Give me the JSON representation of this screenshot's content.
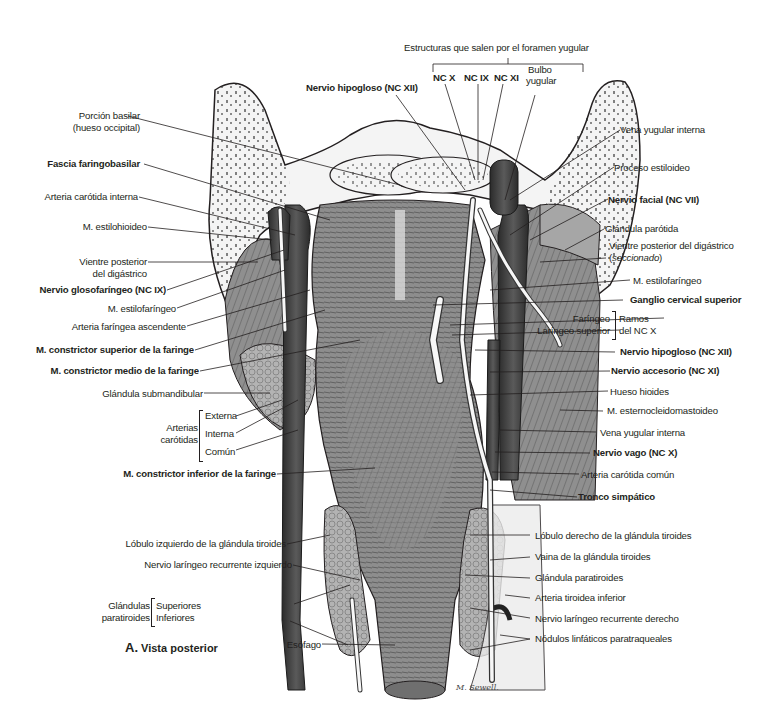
{
  "figure": {
    "caption_letter": "A.",
    "caption_text": "Vista posterior",
    "signature": "M. Sewell."
  },
  "top_group": {
    "title": "Estructuras que salen por el foramen yugular",
    "items": [
      "NC X",
      "NC IX",
      "NC XI"
    ],
    "bulbo_line1": "Bulbo",
    "bulbo_line2": "yugular"
  },
  "labels_left": [
    {
      "id": "porcion-basilar-1",
      "text": "Porción basilar",
      "bold": false
    },
    {
      "id": "porcion-basilar-2",
      "text": "(hueso occipital)",
      "bold": false
    },
    {
      "id": "fascia-faringobasilar",
      "text": "Fascia faringobasilar",
      "bold": true
    },
    {
      "id": "arteria-carotida-interna",
      "text": "Arteria carótida interna",
      "bold": false
    },
    {
      "id": "m-estilohioideo",
      "text": "M. estilohioideo",
      "bold": false
    },
    {
      "id": "vientre-posterior-1",
      "text": "Vientre posterior",
      "bold": false
    },
    {
      "id": "vientre-posterior-2",
      "text": "del digástrico",
      "bold": false
    },
    {
      "id": "nervio-glosofaringeo",
      "text": "Nervio glosofaríngeo (NC IX)",
      "bold": true
    },
    {
      "id": "m-estilofaringeo-left",
      "text": "M. estilofaríngeo",
      "bold": false
    },
    {
      "id": "arteria-faringea-ascendente",
      "text": "Arteria faríngea ascendente",
      "bold": false
    },
    {
      "id": "m-constrictor-superior",
      "text": "M. constrictor superior de la faringe",
      "bold": true
    },
    {
      "id": "m-constrictor-medio",
      "text": "M. constrictor medio de la faringe",
      "bold": true
    },
    {
      "id": "glandula-submandibular",
      "text": "Glándula submandibular",
      "bold": false
    },
    {
      "id": "m-constrictor-inferior",
      "text": "M. constrictor inferior de la faringe",
      "bold": true
    },
    {
      "id": "lobulo-izquierdo",
      "text": "Lóbulo izquierdo de la glándula tiroides",
      "bold": false
    },
    {
      "id": "nervio-laringeo-izq",
      "text": "Nervio laríngeo recurrente izquierdo",
      "bold": false
    },
    {
      "id": "esofago",
      "text": "Esófago",
      "bold": false
    }
  ],
  "nervio_hipogloso_top": "Nervio hipogloso (NC XII)",
  "arterias_carotidas": {
    "group_line1": "Arterias",
    "group_line2": "carótidas",
    "items": [
      "Externa",
      "Interna",
      "Común"
    ]
  },
  "glandulas_paratiroides": {
    "group_line1": "Glándulas",
    "group_line2": "paratiroides",
    "items": [
      "Superiores",
      "Inferiores"
    ]
  },
  "labels_right": [
    {
      "id": "vena-yugular-interna-top",
      "text": "Vena yugular interna",
      "bold": false
    },
    {
      "id": "proceso-estiloideo",
      "text": "Proceso estiloideo",
      "bold": false
    },
    {
      "id": "nervio-facial",
      "text": "Nervio facial (NC VII)",
      "bold": true
    },
    {
      "id": "glandula-parotida",
      "text": "Glándula parótida",
      "bold": false
    },
    {
      "id": "vientre-posterior-digastrico",
      "text": "Vientre posterior del digástrico",
      "bold": false
    },
    {
      "id": "seccionado",
      "text": "seccionado",
      "bold": false
    },
    {
      "id": "m-estilofaringeo-right",
      "text": "M. estilofaríngeo",
      "bold": false
    },
    {
      "id": "ganglio-cervical",
      "text": "Ganglio cervical superior",
      "bold": true
    },
    {
      "id": "nervio-hipogloso-right",
      "text": "Nervio hipogloso (NC XII)",
      "bold": true
    },
    {
      "id": "nervio-accesorio",
      "text": "Nervio accesorio (NC XI)",
      "bold": true
    },
    {
      "id": "hueso-hioides",
      "text": "Hueso hioides",
      "bold": false
    },
    {
      "id": "m-esternocleidomastoideo",
      "text": "M. esternocleidomastoideo",
      "bold": false
    },
    {
      "id": "vena-yugular-interna-low",
      "text": "Vena yugular interna",
      "bold": false
    },
    {
      "id": "nervio-vago",
      "text": "Nervio vago (NC X)",
      "bold": true
    },
    {
      "id": "arteria-carotida-comun",
      "text": "Arteria carótida común",
      "bold": false
    },
    {
      "id": "tronco-simpatico",
      "text": "Tronco simpático",
      "bold": true
    },
    {
      "id": "lobulo-derecho",
      "text": "Lóbulo derecho de la glándula tiroides",
      "bold": false
    },
    {
      "id": "vaina-glandula",
      "text": "Vaina de la glándula tiroides",
      "bold": false
    },
    {
      "id": "glandula-paratiroides-right",
      "text": "Glándula paratiroides",
      "bold": false
    },
    {
      "id": "arteria-tiroidea-inferior",
      "text": "Arteria tiroidea inferior",
      "bold": false
    },
    {
      "id": "nervio-laringeo-der",
      "text": "Nervio laríngeo recurrente derecho",
      "bold": false
    },
    {
      "id": "nodulos-linfaticos",
      "text": "Nódulos linfáticos paratraqueales",
      "bold": false
    }
  ],
  "ramos_nc_x": {
    "group_line1": "Ramos",
    "group_line2": "del NC X",
    "items": [
      "Faríngeo",
      "Laríngeo superior"
    ]
  },
  "colors": {
    "ink": "#231f20",
    "bone": "#f2f2f2",
    "muscle": "#8c8c8c",
    "muscle_dark": "#5e5e5e",
    "vessel": "#3a3a3a",
    "nerve": "#f4f4f4",
    "gland": "#b5b5b5"
  }
}
